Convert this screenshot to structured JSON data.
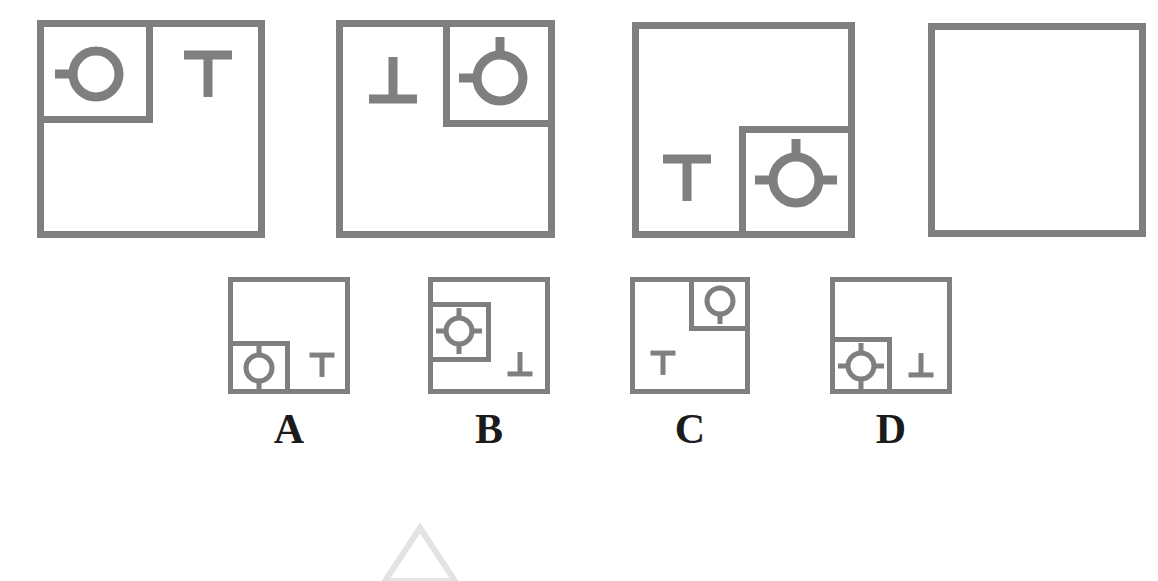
{
  "puzzle": {
    "type": "visual-analogy-matrix",
    "stroke_color": "#7f7f7f",
    "label_color": "#1b1b1b",
    "background": "#ffffff",
    "sequence_title": "",
    "sequence": [
      {
        "name": "panel-1",
        "outer_square": {
          "x": 37,
          "y": 20,
          "w": 228,
          "h": 218
        },
        "inner_square": {
          "x": 37,
          "y": 20,
          "w": 116,
          "h": 103,
          "corner": "top-left"
        },
        "circle": {
          "cx": 96,
          "cy": 74,
          "r": 23,
          "stubs": [
            "left"
          ],
          "inside_inner": true
        },
        "tee": {
          "glyph": "T",
          "orientation": "up",
          "cx": 208,
          "cy": 76,
          "inside_inner": false
        }
      },
      {
        "name": "panel-2",
        "outer_square": {
          "x": 336,
          "y": 20,
          "w": 219,
          "h": 218
        },
        "inner_square": {
          "x": 443,
          "y": 20,
          "w": 112,
          "h": 107,
          "corner": "top-right"
        },
        "circle": {
          "cx": 500,
          "cy": 78,
          "r": 23,
          "stubs": [
            "left",
            "top"
          ],
          "inside_inner": true
        },
        "tee": {
          "glyph": "⊥",
          "orientation": "down",
          "cx": 393,
          "cy": 78,
          "inside_inner": false
        }
      },
      {
        "name": "panel-3",
        "outer_square": {
          "x": 632,
          "y": 22,
          "w": 223,
          "h": 216
        },
        "inner_square": {
          "x": 739,
          "y": 126,
          "w": 116,
          "h": 112,
          "corner": "bottom-right"
        },
        "circle": {
          "cx": 796,
          "cy": 180,
          "r": 23,
          "stubs": [
            "left",
            "right",
            "top"
          ],
          "inside_inner": true
        },
        "tee": {
          "glyph": "T",
          "orientation": "up",
          "cx": 687,
          "cy": 180,
          "inside_inner": false
        }
      },
      {
        "name": "panel-4",
        "outer_square": {
          "x": 928,
          "y": 23,
          "w": 218,
          "h": 214
        },
        "inner_square": null,
        "circle": null,
        "tee": null,
        "is_question": true
      }
    ],
    "options": [
      {
        "label": "A",
        "name": "option-a",
        "outer_square": {
          "x": 228,
          "y": 277,
          "w": 122,
          "h": 117
        },
        "inner_square": {
          "x": 228,
          "y": 341,
          "w": 62,
          "h": 53,
          "corner": "bottom-left"
        },
        "circle": {
          "cx": 259,
          "cy": 368,
          "r": 13,
          "stubs": [
            "top",
            "bottom"
          ],
          "inside_inner": true
        },
        "tee": {
          "glyph": "T",
          "orientation": "up",
          "cx": 322,
          "cy": 366,
          "inside_inner": false
        }
      },
      {
        "label": "B",
        "name": "option-b",
        "outer_square": {
          "x": 428,
          "y": 277,
          "w": 122,
          "h": 117
        },
        "inner_square": {
          "x": 428,
          "y": 302,
          "w": 63,
          "h": 60,
          "corner": "mid-left"
        },
        "circle": {
          "cx": 459,
          "cy": 331,
          "r": 13,
          "stubs": [
            "left",
            "right",
            "top",
            "bottom"
          ],
          "inside_inner": true
        },
        "tee": {
          "glyph": "⊥",
          "orientation": "down",
          "cx": 520,
          "cy": 363,
          "inside_inner": false
        }
      },
      {
        "label": "C",
        "name": "option-c",
        "outer_square": {
          "x": 630,
          "y": 277,
          "w": 120,
          "h": 117
        },
        "inner_square": {
          "x": 689,
          "y": 277,
          "w": 61,
          "h": 54,
          "corner": "top-right"
        },
        "circle": {
          "cx": 720,
          "cy": 301,
          "r": 13,
          "stubs": [
            "bottom"
          ],
          "inside_inner": true
        },
        "tee": {
          "glyph": "T",
          "orientation": "up",
          "cx": 663,
          "cy": 364,
          "inside_inner": false
        }
      },
      {
        "label": "D",
        "name": "option-d",
        "outer_square": {
          "x": 830,
          "y": 277,
          "w": 122,
          "h": 117
        },
        "inner_square": {
          "x": 830,
          "y": 337,
          "w": 62,
          "h": 57,
          "corner": "bottom-left"
        },
        "circle": {
          "cx": 861,
          "cy": 366,
          "r": 13,
          "stubs": [
            "left",
            "right",
            "top",
            "bottom"
          ],
          "inside_inner": true
        },
        "tee": {
          "glyph": "⊥",
          "orientation": "down",
          "cx": 921,
          "cy": 364,
          "inside_inner": false
        }
      }
    ],
    "option_labels": {
      "a": "A",
      "b": "B",
      "c": "C",
      "d": "D"
    },
    "watermark": {
      "shape": "triangle-outline",
      "color": "#e3e3e3",
      "x": 385,
      "y": 528,
      "w": 70,
      "h": 53
    }
  }
}
